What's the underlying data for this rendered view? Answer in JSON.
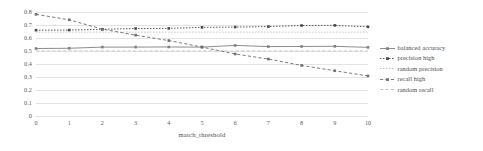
{
  "chart_data": {
    "type": "line",
    "title": "",
    "xlabel": "match_threshold",
    "ylabel": "",
    "x": [
      0,
      1,
      2,
      3,
      4,
      5,
      6,
      7,
      8,
      9,
      10
    ],
    "xlim": [
      0,
      10
    ],
    "ylim": [
      0,
      0.8
    ],
    "xticks": [
      "0",
      "1",
      "2",
      "3",
      "4",
      "5",
      "6",
      "7",
      "8",
      "9",
      "10"
    ],
    "yticks": [
      "0",
      "0.1",
      "0.2",
      "0.3",
      "0.4",
      "0.5",
      "0.6",
      "0.7",
      "0.8"
    ],
    "grid": true,
    "legend_position": "right",
    "series": [
      {
        "name": "balanced accuracy",
        "style": "solid",
        "marker": "square",
        "color": "#808080",
        "values": [
          0.519,
          0.521,
          0.53,
          0.53,
          0.531,
          0.53,
          0.543,
          0.534,
          0.535,
          0.536,
          0.528
        ]
      },
      {
        "name": "precision high",
        "style": "dotted",
        "marker": "square",
        "color": "#4a4a4a",
        "values": [
          0.66,
          0.661,
          0.667,
          0.673,
          0.674,
          0.682,
          0.684,
          0.688,
          0.696,
          0.697,
          0.686
        ]
      },
      {
        "name": "random precision",
        "style": "dotted",
        "marker": "none",
        "color": "#b4b4b4",
        "values": [
          0.645,
          0.645,
          0.645,
          0.645,
          0.645,
          0.645,
          0.645,
          0.645,
          0.645,
          0.645,
          0.645
        ]
      },
      {
        "name": "recall high",
        "style": "dashed",
        "marker": "square",
        "color": "#6e6e6e",
        "values": [
          0.782,
          0.74,
          0.668,
          0.622,
          0.58,
          0.53,
          0.477,
          0.438,
          0.389,
          0.348,
          0.308
        ]
      },
      {
        "name": "random recall",
        "style": "dashed",
        "marker": "none",
        "color": "#c0c0c0",
        "values": [
          0.501,
          0.501,
          0.501,
          0.501,
          0.501,
          0.501,
          0.501,
          0.501,
          0.501,
          0.501,
          0.501
        ]
      }
    ]
  },
  "legend": {
    "items": [
      {
        "label": "balanced accuracy"
      },
      {
        "label": "precision high"
      },
      {
        "label": "random precision"
      },
      {
        "label": "recall high"
      },
      {
        "label": "random recall"
      }
    ]
  }
}
